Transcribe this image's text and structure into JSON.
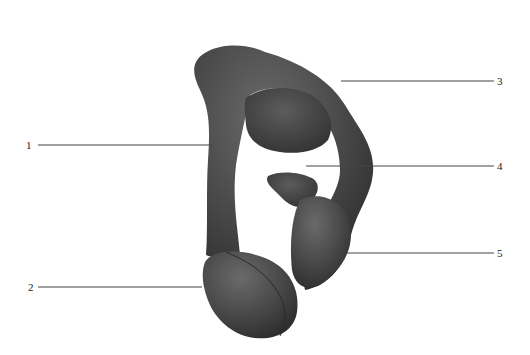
{
  "figure": {
    "background_color": "#ffffff",
    "model_color": "#4a4a4a",
    "line_color": "#444444"
  },
  "labels": [
    {
      "id": "1",
      "text": "1",
      "side": "left"
    },
    {
      "id": "2",
      "text": "2",
      "side": "left"
    },
    {
      "id": "3",
      "text": "3",
      "side": "right"
    },
    {
      "id": "4",
      "text": "4",
      "side": "right"
    },
    {
      "id": "5",
      "text": "5",
      "side": "right"
    }
  ]
}
